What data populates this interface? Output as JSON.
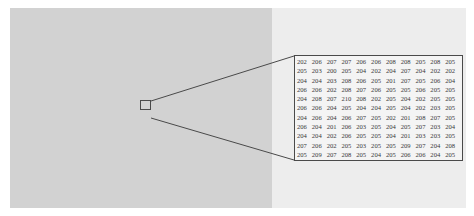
{
  "figure": {
    "colors": {
      "left_region": "#d2d2d2",
      "right_region": "#ededed",
      "box_border": "#4a4a4a",
      "text": "#3a3a3a"
    },
    "pixel_grid": [
      [
        "202",
        "206",
        "207",
        "207",
        "206",
        "206",
        "208",
        "208",
        "205",
        "208",
        "205"
      ],
      [
        "205",
        "203",
        "200",
        "205",
        "204",
        "202",
        "204",
        "207",
        "204",
        "202",
        "202"
      ],
      [
        "204",
        "204",
        "203",
        "208",
        "206",
        "205",
        "201",
        "207",
        "205",
        "206",
        "204"
      ],
      [
        "206",
        "206",
        "202",
        "208",
        "207",
        "206",
        "205",
        "205",
        "206",
        "205",
        "205"
      ],
      [
        "204",
        "208",
        "207",
        "210",
        "208",
        "202",
        "205",
        "204",
        "202",
        "205",
        "205"
      ],
      [
        "206",
        "206",
        "204",
        "205",
        "204",
        "204",
        "205",
        "204",
        "202",
        "203",
        "205"
      ],
      [
        "204",
        "206",
        "204",
        "206",
        "207",
        "205",
        "202",
        "201",
        "208",
        "207",
        "205"
      ],
      [
        "206",
        "204",
        "201",
        "206",
        "203",
        "205",
        "204",
        "205",
        "207",
        "203",
        "204"
      ],
      [
        "204",
        "204",
        "202",
        "206",
        "205",
        "205",
        "204",
        "201",
        "203",
        "203",
        "205"
      ],
      [
        "207",
        "206",
        "202",
        "205",
        "203",
        "205",
        "205",
        "209",
        "207",
        "204",
        "208"
      ],
      [
        "205",
        "209",
        "207",
        "208",
        "205",
        "204",
        "205",
        "206",
        "206",
        "204",
        "205"
      ]
    ]
  }
}
